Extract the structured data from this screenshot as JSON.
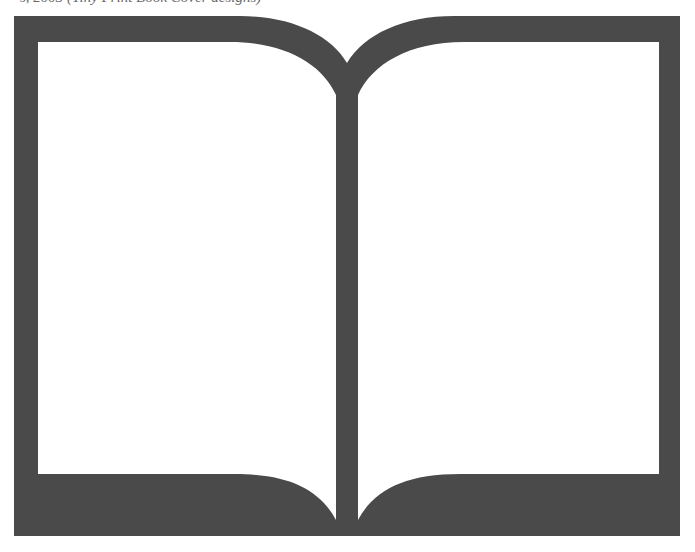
{
  "caption": {
    "text": "s, 2003 (Tiny Print Book Cover designs)"
  },
  "icon": {
    "name": "open-book-icon",
    "fill_color": "#4a4a4a",
    "page_color": "#ffffff"
  }
}
